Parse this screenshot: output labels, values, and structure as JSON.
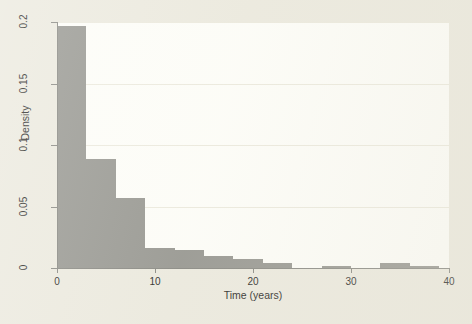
{
  "chart_data": {
    "type": "bar",
    "subtype": "histogram",
    "title": "",
    "xlabel": "Time (years)",
    "ylabel": "Density",
    "xlim": [
      0,
      40
    ],
    "ylim": [
      0,
      0.2
    ],
    "grid": true,
    "legend": null,
    "bin_width": 3,
    "bar_color": "#9a9a94",
    "plot_background": "#fdfdf8",
    "figure_background": "#eceadf",
    "axis_color": "#8c8c86",
    "xticks": [
      0,
      10,
      20,
      30,
      40
    ],
    "xtick_labels": [
      "0",
      "10",
      "20",
      "30",
      "40"
    ],
    "yticks": [
      0,
      0.05,
      0.1,
      0.15,
      0.2
    ],
    "ytick_labels": [
      "0",
      "0.05",
      "0.1",
      "0.15",
      "0.2"
    ],
    "bins": [
      {
        "x0": 0,
        "x1": 3,
        "density": 0.197
      },
      {
        "x0": 3,
        "x1": 6,
        "density": 0.089
      },
      {
        "x0": 6,
        "x1": 9,
        "density": 0.057
      },
      {
        "x0": 9,
        "x1": 12,
        "density": 0.016
      },
      {
        "x0": 12,
        "x1": 15,
        "density": 0.015
      },
      {
        "x0": 15,
        "x1": 18,
        "density": 0.01
      },
      {
        "x0": 18,
        "x1": 21,
        "density": 0.007
      },
      {
        "x0": 21,
        "x1": 24,
        "density": 0.004
      },
      {
        "x0": 24,
        "x1": 27,
        "density": 0.0
      },
      {
        "x0": 27,
        "x1": 30,
        "density": 0.002
      },
      {
        "x0": 30,
        "x1": 33,
        "density": 0.0
      },
      {
        "x0": 33,
        "x1": 36,
        "density": 0.004
      },
      {
        "x0": 36,
        "x1": 39,
        "density": 0.002
      }
    ],
    "categories": [
      "0-3",
      "3-6",
      "6-9",
      "9-12",
      "12-15",
      "15-18",
      "18-21",
      "21-24",
      "24-27",
      "27-30",
      "30-33",
      "33-36",
      "36-39"
    ],
    "values": [
      0.197,
      0.089,
      0.057,
      0.016,
      0.015,
      0.01,
      0.007,
      0.004,
      0.0,
      0.002,
      0.0,
      0.004,
      0.002
    ]
  }
}
